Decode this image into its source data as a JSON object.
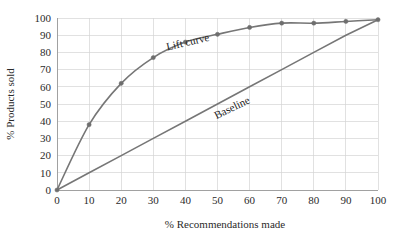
{
  "chart_data": {
    "type": "line",
    "title": "",
    "xlabel": "% Recommendations made",
    "ylabel": "% Products sold",
    "xlim": [
      0,
      100
    ],
    "ylim": [
      0,
      100
    ],
    "xticks": [
      "0",
      "10",
      "20",
      "30",
      "40",
      "50",
      "60",
      "70",
      "80",
      "90",
      "100"
    ],
    "yticks": [
      "0",
      "10",
      "20",
      "30",
      "40",
      "50",
      "60",
      "70",
      "80",
      "90",
      "100"
    ],
    "grid": true,
    "legend_position": "inline-annotation",
    "x": [
      0,
      10,
      20,
      30,
      40,
      50,
      60,
      70,
      80,
      90,
      100
    ],
    "series": [
      {
        "name": "Lift curve",
        "values": [
          0,
          38,
          62,
          77,
          86,
          90.5,
          94.5,
          97,
          97,
          98,
          99
        ],
        "markers": true,
        "color": "#767676"
      },
      {
        "name": "Baseline",
        "values": [
          0,
          10,
          20,
          30,
          40,
          50,
          60,
          70,
          80,
          90,
          99
        ],
        "markers": false,
        "color": "#767676"
      }
    ],
    "annotations": [
      {
        "text": "Lift curve",
        "x": 41,
        "y": 84,
        "rotation": -13
      },
      {
        "text": "Baseline",
        "x": 55,
        "y": 46,
        "rotation": -26
      }
    ],
    "colors": {
      "line": "#767676",
      "marker": "#6e6e6e",
      "grid": "#d4d4d4",
      "axis": "#9a9a9a",
      "text": "#2b2b2b",
      "background": "#ffffff"
    }
  }
}
